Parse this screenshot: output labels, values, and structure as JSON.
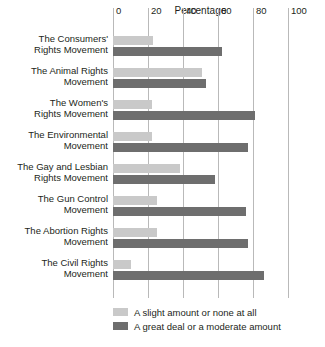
{
  "chart_data": {
    "type": "bar",
    "orientation": "horizontal",
    "title": "Percentage",
    "xlabel": "",
    "ylabel": "",
    "xlim": [
      0,
      100
    ],
    "xticks": [
      0,
      20,
      40,
      60,
      80,
      100
    ],
    "grid": true,
    "legend_position": "bottom-left",
    "categories": [
      "The Consumers' Rights Movement",
      "The Animal Rights Movement",
      "The Women's Rights Movement",
      "The Environmental Movement",
      "The Gay and Lesbian Rights Movement",
      "The Gun Control Movement",
      "The Abortion Rights Movement",
      "The Civil Rights Movement"
    ],
    "category_lines": [
      [
        "The Consumers'",
        "Rights Movement"
      ],
      [
        "The Animal Rights",
        "Movement"
      ],
      [
        "The Women's",
        "Rights Movement"
      ],
      [
        "The Environmental",
        "Movement"
      ],
      [
        "The Gay and Lesbian",
        "Rights Movement"
      ],
      [
        "The Gun Control",
        "Movement"
      ],
      [
        "The Abortion Rights",
        "Movement"
      ],
      [
        "The Civil Rights",
        "Movement"
      ]
    ],
    "series": [
      {
        "name": "A slight amount or none at all",
        "color": "#c9c9c9",
        "values": [
          23,
          51,
          22,
          22,
          38,
          25,
          25,
          10
        ]
      },
      {
        "name": "A great deal or a moderate amount",
        "color": "#6e6e6e",
        "values": [
          62,
          53,
          81,
          77,
          58,
          76,
          77,
          86
        ]
      }
    ]
  },
  "legend": {
    "items": [
      {
        "label": "A slight amount or none at all",
        "color": "#c9c9c9"
      },
      {
        "label": "A great deal or a moderate amount",
        "color": "#6e6e6e"
      }
    ]
  }
}
